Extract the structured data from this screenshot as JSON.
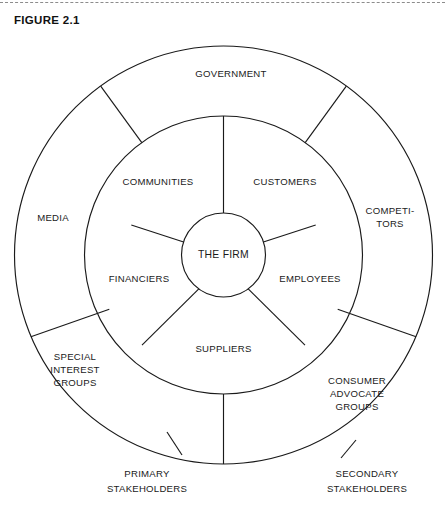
{
  "figure": {
    "label": "FIGURE 2.1",
    "divider": "dashed-rule"
  },
  "diagram": {
    "type": "concentric-stakeholder-wheel",
    "center": {
      "label": "THE FIRM"
    },
    "inner_ring": {
      "name": "primary-stakeholders-ring",
      "segments": [
        {
          "label": "COMMUNITIES"
        },
        {
          "label": "CUSTOMERS"
        },
        {
          "label": "EMPLOYEES"
        },
        {
          "label": "SUPPLIERS"
        },
        {
          "label": "FINANCIERS"
        }
      ]
    },
    "outer_ring": {
      "name": "secondary-stakeholders-ring",
      "segments": [
        {
          "label": "GOVERNMENT",
          "lines": [
            "GOVERNMENT"
          ]
        },
        {
          "label": "COMPETITORS",
          "lines": [
            "COMPETI-",
            "TORS"
          ]
        },
        {
          "label": "CONSUMER ADVOCATE GROUPS",
          "lines": [
            "CONSUMER",
            "ADVOCATE",
            "GROUPS"
          ]
        },
        {
          "label": "SPECIAL INTEREST GROUPS",
          "lines": [
            "SPECIAL",
            "INTEREST",
            "GROUPS"
          ]
        },
        {
          "label": "MEDIA",
          "lines": [
            "MEDIA"
          ]
        }
      ]
    },
    "legend": [
      {
        "name": "primary",
        "lines": [
          "PRIMARY",
          "STAKEHOLDERS"
        ]
      },
      {
        "name": "secondary",
        "lines": [
          "SECONDARY",
          "STAKEHOLDERS"
        ]
      }
    ],
    "colors": {
      "stroke": "#1a1a1a",
      "background": "#ffffff",
      "divider": "#8c8c8c"
    }
  }
}
